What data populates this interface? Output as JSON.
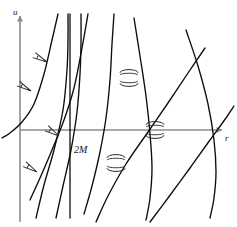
{
  "figure": {
    "kind": "spacetime-diagram",
    "width": 237,
    "height": 227,
    "background_color": "#ffffff"
  },
  "labels": {
    "y_axis": "u",
    "x_axis": "r",
    "horizon": "2M"
  },
  "colors": {
    "axis": "#8c8c8c",
    "curve": "#0d0d0d",
    "cone": "#2a2a2a",
    "text": "#1a1a1a"
  },
  "chart_data": {
    "type": "line",
    "title": "",
    "xlabel": "r",
    "ylabel": "u",
    "grid": false,
    "legend": false,
    "annotations": [
      {
        "text": "2M",
        "x": 74,
        "y": 152,
        "role": "horizon-label"
      },
      {
        "text": "u",
        "x": 13,
        "y": 13,
        "role": "axis-label"
      },
      {
        "text": "r",
        "x": 225,
        "y": 139,
        "role": "axis-label"
      }
    ],
    "axes": {
      "origin": [
        20,
        130
      ],
      "x_axis": {
        "from": [
          20,
          130
        ],
        "to": [
          222,
          130
        ],
        "arrow": "right"
      },
      "y_axis": {
        "from": [
          20,
          222
        ],
        "to": [
          20,
          16
        ],
        "arrow": "up"
      }
    },
    "horizon_line": {
      "x": 70,
      "from_y": 14,
      "to_y": 218
    },
    "series": [
      {
        "name": "outgoing-null-geodesics",
        "description": "Curves asymptotic to r=2M on the left, straightening to +45 degrees at large r",
        "paths": [
          [
            [
              36,
              218
            ],
            [
              44,
              185
            ],
            [
              54,
              150
            ],
            [
              63,
              110
            ],
            [
              67,
              70
            ],
            [
              68,
              40
            ],
            [
              68,
              14
            ]
          ],
          [
            [
              56,
              218
            ],
            [
              63,
              186
            ],
            [
              71,
              150
            ],
            [
              77,
              112
            ],
            [
              80,
              74
            ],
            [
              81,
              42
            ],
            [
              81,
              14
            ]
          ],
          [
            [
              96,
              222
            ],
            [
              108,
              196
            ],
            [
              126,
              164
            ],
            [
              148,
              132
            ],
            [
              170,
              100
            ],
            [
              190,
              70
            ],
            [
              205,
              48
            ]
          ],
          [
            [
              150,
              222
            ],
            [
              168,
              198
            ],
            [
              190,
              168
            ],
            [
              210,
              140
            ],
            [
              226,
              118
            ],
            [
              234,
              106
            ]
          ]
        ]
      },
      {
        "name": "ingoing-null-geodesics",
        "description": "Curves steep near r=2M, flattening to -45 degrees at large r",
        "paths": [
          [
            [
              58,
              14
            ],
            [
              52,
              40
            ],
            [
              44,
              74
            ],
            [
              34,
              104
            ],
            [
              22,
              122
            ],
            [
              10,
              133
            ],
            [
              2,
              138
            ]
          ],
          [
            [
              88,
              14
            ],
            [
              82,
              48
            ],
            [
              74,
              88
            ],
            [
              64,
              120
            ],
            [
              52,
              150
            ],
            [
              40,
              178
            ],
            [
              30,
              200
            ]
          ],
          [
            [
              114,
              14
            ],
            [
              112,
              44
            ],
            [
              110,
              80
            ],
            [
              106,
              118
            ],
            [
              100,
              152
            ],
            [
              92,
              186
            ],
            [
              84,
              214
            ]
          ],
          [
            [
              134,
              18
            ],
            [
              140,
              56
            ],
            [
              146,
              96
            ],
            [
              150,
              134
            ],
            [
              152,
              168
            ],
            [
              150,
              198
            ],
            [
              146,
              220
            ]
          ],
          [
            [
              186,
              30
            ],
            [
              198,
              66
            ],
            [
              208,
              104
            ],
            [
              214,
              140
            ],
            [
              216,
              172
            ],
            [
              214,
              198
            ],
            [
              210,
              218
            ]
          ]
        ]
      }
    ],
    "light_cones": [
      {
        "x": 47,
        "y": 62,
        "opening": 22,
        "tilt": -62,
        "style": "narrow-up"
      },
      {
        "x": 31,
        "y": 91,
        "opening": 20,
        "tilt": -60,
        "style": "narrow-up"
      },
      {
        "x": 59,
        "y": 136,
        "opening": 24,
        "tilt": -58,
        "style": "narrow-up"
      },
      {
        "x": 37,
        "y": 172,
        "opening": 22,
        "tilt": -58,
        "style": "narrow-up"
      },
      {
        "x": 129,
        "y": 78,
        "opening": 52,
        "tilt": 0,
        "style": "wide-double"
      },
      {
        "x": 155,
        "y": 130,
        "opening": 56,
        "tilt": 0,
        "style": "wide-double"
      },
      {
        "x": 116,
        "y": 163,
        "opening": 50,
        "tilt": 0,
        "style": "wide-double"
      }
    ]
  }
}
